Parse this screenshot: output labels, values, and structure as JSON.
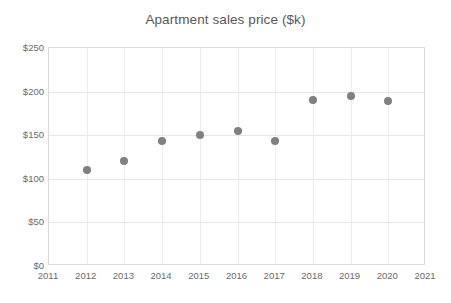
{
  "chart_data": {
    "type": "scatter",
    "title": "Apartment sales price ($k)",
    "xlabel": "",
    "ylabel": "",
    "x": [
      2012,
      2013,
      2014,
      2015,
      2016,
      2017,
      2018,
      2019,
      2020
    ],
    "values": [
      110,
      120,
      143,
      150,
      155,
      143,
      190,
      195,
      189
    ],
    "points": [
      {
        "x": 2012,
        "y": 110
      },
      {
        "x": 2013,
        "y": 120
      },
      {
        "x": 2014,
        "y": 143
      },
      {
        "x": 2015,
        "y": 150
      },
      {
        "x": 2016,
        "y": 155
      },
      {
        "x": 2017,
        "y": 143
      },
      {
        "x": 2018,
        "y": 190
      },
      {
        "x": 2019,
        "y": 195
      },
      {
        "x": 2020,
        "y": 189
      }
    ],
    "xlim": [
      2011,
      2021
    ],
    "ylim": [
      0,
      250
    ],
    "x_tick_labels": [
      "2011",
      "2012",
      "2013",
      "2014",
      "2015",
      "2016",
      "2017",
      "2018",
      "2019",
      "2020",
      "2021"
    ],
    "x_tick_values": [
      2011,
      2012,
      2013,
      2014,
      2015,
      2016,
      2017,
      2018,
      2019,
      2020,
      2021
    ],
    "y_tick_labels": [
      "$0",
      "$50",
      "$100",
      "$150",
      "$200",
      "$250"
    ],
    "y_tick_values": [
      0,
      50,
      100,
      150,
      200,
      250
    ],
    "grid": true,
    "legend": false,
    "marker_color": "#808083",
    "gridline_color": "#e6e6e6",
    "axis_border_color": "#d9d9d9",
    "text_color": "#6b6b6d",
    "title_color": "#58585a",
    "background_color": "#ffffff"
  }
}
